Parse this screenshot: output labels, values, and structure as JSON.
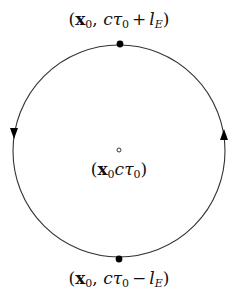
{
  "diagram": {
    "type": "closed-contour",
    "circle": {
      "cx": 119,
      "cy": 151,
      "r": 106,
      "stroke": "#333333"
    },
    "points": {
      "top": {
        "cx": 120,
        "cy": 44,
        "filled": true
      },
      "center": {
        "cx": 119,
        "cy": 150,
        "filled": false
      },
      "bottom": {
        "cx": 119,
        "cy": 259,
        "filled": true
      }
    },
    "arrows": {
      "left": {
        "direction": "down"
      },
      "right": {
        "direction": "up"
      }
    },
    "labels": {
      "top": {
        "open": "(",
        "vec": "x",
        "vec_sub": "0",
        "comma": ",",
        "c": "c",
        "tau": "τ",
        "tau_sub": "0",
        "op": "+",
        "l": "l",
        "l_sub": "E",
        "close": ")"
      },
      "center": {
        "open": "(",
        "vec": "x",
        "vec_sub": "0",
        "c": "c",
        "tau": "τ",
        "tau_sub": "0",
        "close": ")"
      },
      "bottom": {
        "open": "(",
        "vec": "x",
        "vec_sub": "0",
        "comma": ",",
        "c": "c",
        "tau": "τ",
        "tau_sub": "0",
        "op": "−",
        "l": "l",
        "l_sub": "E",
        "close": ")"
      }
    }
  }
}
